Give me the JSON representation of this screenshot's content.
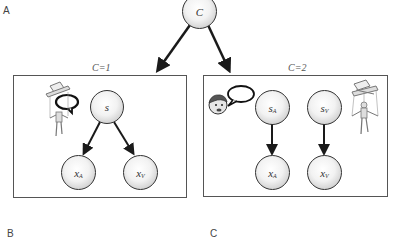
{
  "panels": {
    "a": "A",
    "b": "B",
    "c": "C"
  },
  "root_node": {
    "label": "C"
  },
  "plates": [
    {
      "title": "C=1",
      "nodes": [
        {
          "id": "s",
          "label": "s",
          "sub": ""
        },
        {
          "id": "xA",
          "label": "x",
          "sub": "A"
        },
        {
          "id": "xV",
          "label": "x",
          "sub": "V"
        }
      ]
    },
    {
      "title": "C=2",
      "nodes": [
        {
          "id": "sA",
          "label": "s",
          "sub": "A"
        },
        {
          "id": "sV",
          "label": "s",
          "sub": "V"
        },
        {
          "id": "xA",
          "label": "x",
          "sub": "A"
        },
        {
          "id": "xV",
          "label": "x",
          "sub": "V"
        }
      ]
    }
  ],
  "illustrations": {
    "plate1": "ventriloquist-puppet-with-speech-bubble",
    "plate2_left": "speaking-face-with-speech-bubble",
    "plate2_right": "marionette-puppet"
  },
  "colors": {
    "edge": "#1a1a1a",
    "plate_border": "#555555",
    "node_border": "#333333"
  }
}
